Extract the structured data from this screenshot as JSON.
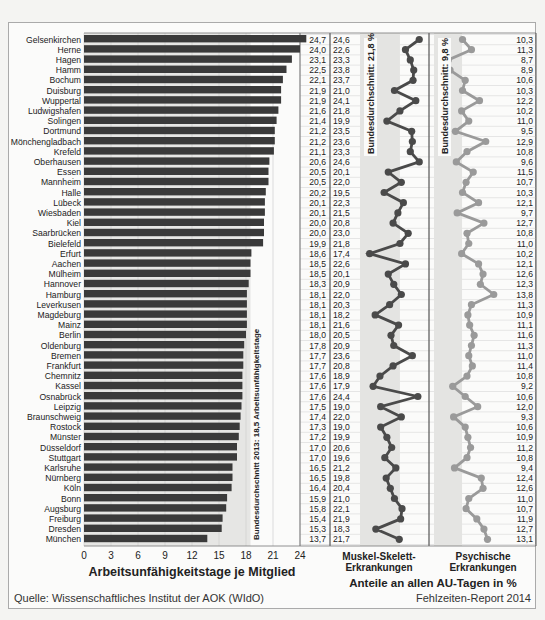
{
  "chart_data": [
    {
      "type": "bar",
      "orientation": "horizontal",
      "title": "",
      "xlabel": "Arbeitsunfähigkeitstage je Mitglied",
      "ylabel": "",
      "xlim": [
        0,
        24
      ],
      "xticks": [
        0,
        3,
        6,
        9,
        12,
        15,
        18,
        21,
        24
      ],
      "reference_line": {
        "value": 18.5,
        "label": "Bundesdurchschnitt 2013: 18,5 Arbeitsunfähigkeitstage"
      },
      "categories": [
        "Gelsenkirchen",
        "Herne",
        "Hagen",
        "Hamm",
        "Bochum",
        "Duisburg",
        "Wuppertal",
        "Ludwigshafen",
        "Solingen",
        "Dortmund",
        "Mönchengladbach",
        "Krefeld",
        "Oberhausen",
        "Essen",
        "Mannheim",
        "Halle",
        "Lübeck",
        "Wiesbaden",
        "Kiel",
        "Saarbrücken",
        "Bielefeld",
        "Erfurt",
        "Aachen",
        "Mülheim",
        "Hannover",
        "Hamburg",
        "Leverkusen",
        "Magdeburg",
        "Mainz",
        "Berlin",
        "Oldenburg",
        "Bremen",
        "Frankfurt",
        "Chemnitz",
        "Kassel",
        "Osnabrück",
        "Leipzig",
        "Braunschweig",
        "Rostock",
        "Münster",
        "Düsseldorf",
        "Stuttgart",
        "Karlsruhe",
        "Nürnberg",
        "Köln",
        "Bonn",
        "Augsburg",
        "Freiburg",
        "Dresden",
        "München"
      ],
      "values": [
        24.7,
        24.0,
        23.1,
        22.5,
        22.1,
        21.9,
        21.9,
        21.6,
        21.4,
        21.2,
        21.2,
        21.1,
        20.6,
        20.5,
        20.5,
        20.2,
        20.1,
        20.1,
        20.0,
        20.0,
        19.9,
        18.6,
        18.5,
        18.5,
        18.3,
        18.1,
        18.1,
        18.1,
        18.1,
        18.0,
        17.8,
        17.7,
        17.7,
        17.6,
        17.6,
        17.6,
        17.5,
        17.4,
        17.3,
        17.2,
        17.0,
        17.0,
        16.5,
        16.5,
        16.4,
        15.9,
        15.8,
        15.4,
        15.3,
        13.7
      ],
      "value_labels": [
        "24,7",
        "24,0",
        "23,1",
        "22,5",
        "22,1",
        "21,9",
        "21,9",
        "21,6",
        "21,4",
        "21,2",
        "21,2",
        "21,1",
        "20,6",
        "20,5",
        "20,5",
        "20,2",
        "20,1",
        "20,1",
        "20,0",
        "20,0",
        "19,9",
        "18,6",
        "18,5",
        "18,5",
        "18,3",
        "18,1",
        "18,1",
        "18,1",
        "18,1",
        "18,0",
        "17,8",
        "17,7",
        "17,7",
        "17,6",
        "17,6",
        "17,6",
        "17,5",
        "17,4",
        "17,3",
        "17,2",
        "17,0",
        "17,0",
        "16,5",
        "16,5",
        "16,4",
        "15,9",
        "15,8",
        "15,4",
        "15,3",
        "13,7"
      ]
    },
    {
      "type": "line",
      "name": "Muskel-Skelett-Erkrankungen",
      "reference_line": {
        "value": 21.8,
        "label": "Bundesdurchschnitt: 21,8 %"
      },
      "values": [
        24.6,
        22.6,
        23.3,
        23.8,
        23.7,
        21.0,
        24.1,
        21.8,
        19.9,
        23.5,
        23.6,
        23.3,
        24.6,
        20.1,
        22.0,
        19.5,
        22.3,
        21.5,
        20.8,
        23.0,
        21.8,
        17.4,
        22.6,
        20.1,
        20.9,
        22.0,
        20.3,
        18.2,
        21.6,
        20.5,
        20.9,
        23.6,
        20.8,
        18.9,
        17.9,
        24.4,
        19.0,
        22.0,
        19.0,
        19.9,
        20.6,
        19.6,
        21.2,
        19.8,
        20.4,
        21.0,
        22.1,
        21.9,
        18.3,
        21.7
      ],
      "value_labels": [
        "24,6",
        "22,6",
        "23,3",
        "23,8",
        "23,7",
        "21,0",
        "24,1",
        "21,8",
        "19,9",
        "23,5",
        "23,6",
        "23,3",
        "24,6",
        "20,1",
        "22,0",
        "19,5",
        "22,3",
        "21,5",
        "20,8",
        "23,0",
        "21,8",
        "17,4",
        "22,6",
        "20,1",
        "20,9",
        "22,0",
        "20,3",
        "18,2",
        "21,6",
        "20,5",
        "20,9",
        "23,6",
        "20,8",
        "18,9",
        "17,9",
        "24,4",
        "19,0",
        "22,0",
        "19,0",
        "19,9",
        "20,6",
        "19,6",
        "21,2",
        "19,8",
        "20,4",
        "21,0",
        "22,1",
        "21,9",
        "18,3",
        "21,7"
      ],
      "color": "#4a4a4a"
    },
    {
      "type": "line",
      "name": "Psychische Erkrankungen",
      "reference_line": {
        "value": 9.8,
        "label": "Bundesdurchschnitt: 9,8 %"
      },
      "values": [
        10.3,
        11.3,
        8.7,
        8.9,
        10.6,
        10.3,
        12.2,
        10.2,
        11.0,
        9.5,
        12.9,
        10.8,
        9.6,
        11.5,
        10.7,
        10.3,
        12.1,
        9.7,
        12.7,
        10.8,
        11.0,
        10.2,
        12.1,
        12.6,
        12.3,
        13.8,
        11.3,
        10.9,
        11.1,
        11.6,
        11.3,
        11.0,
        11.4,
        10.8,
        9.2,
        10.6,
        12.0,
        9.3,
        10.6,
        10.9,
        11.2,
        10.8,
        9.4,
        12.4,
        12.6,
        11.0,
        10.7,
        11.9,
        12.7,
        13.1
      ],
      "value_labels": [
        "10,3",
        "11,3",
        "8,7",
        "8,9",
        "10,6",
        "10,3",
        "12,2",
        "10,2",
        "11,0",
        "9,5",
        "12,9",
        "10,8",
        "9,6",
        "11,5",
        "10,7",
        "10,3",
        "12,1",
        "9,7",
        "12,7",
        "10,8",
        "11,0",
        "10,2",
        "12,1",
        "12,6",
        "12,3",
        "13,8",
        "11,3",
        "10,9",
        "11,1",
        "11,6",
        "11,3",
        "11,0",
        "11,4",
        "10,8",
        "9,2",
        "10,6",
        "12,0",
        "9,3",
        "10,6",
        "10,9",
        "11,2",
        "10,8",
        "9,4",
        "12,4",
        "12,6",
        "11,0",
        "10,7",
        "11,9",
        "12,7",
        "13,1"
      ],
      "color": "#9a9a9a"
    }
  ],
  "labels": {
    "x_axis_title": "Arbeitsunfähigkeitstage je Mitglied",
    "col2_title_line1": "Muskel-Skelett-",
    "col2_title_line2": "Erkrankungen",
    "col3_title_line1": "Psychische",
    "col3_title_line2": "Erkrankungen",
    "shared_title": "Anteile an allen AU-Tagen in %",
    "source": "Quelle: Wissenschaftliches Institut der AOK (WIdO)",
    "report": "Fehlzeiten-Report 2014"
  }
}
